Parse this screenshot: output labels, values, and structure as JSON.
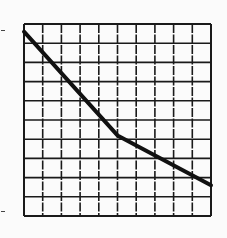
{
  "chart_data": {
    "type": "line",
    "title": "",
    "xlabel": "",
    "ylabel": "",
    "xlim": [
      0,
      10
    ],
    "ylim": [
      0,
      10
    ],
    "grid": true,
    "grid_divisions": {
      "x": 10,
      "y": 10
    },
    "legend": null,
    "series": [
      {
        "name": "curve",
        "color": "#111111",
        "points": [
          [
            0,
            9.6
          ],
          [
            5,
            4.2
          ],
          [
            10,
            1.6
          ]
        ]
      }
    ]
  },
  "layout": {
    "plot_left": 24,
    "plot_top": 24,
    "plot_right": 211,
    "plot_bottom": 216,
    "grid_color": "#1a1a1a",
    "line_color": "#111111",
    "background": "#fbfbfb"
  }
}
